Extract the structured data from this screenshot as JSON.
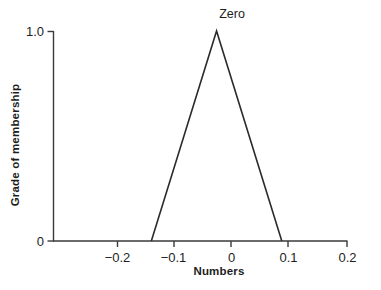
{
  "chart_data": {
    "type": "line",
    "title": "",
    "xlabel": "Numbers",
    "ylabel": "Grade of membership",
    "xlim": [
      -0.25,
      0.2
    ],
    "ylim": [
      0,
      1.0
    ],
    "grid": false,
    "legend": "none",
    "annotations": [
      {
        "text": "Zero",
        "x": 0,
        "y": 1.0
      }
    ],
    "xticks": [
      {
        "value": -0.2,
        "label": "−0.2"
      },
      {
        "value": -0.1,
        "label": "−0.1"
      },
      {
        "value": 0,
        "label": "0"
      },
      {
        "value": 0.1,
        "label": "0.1"
      },
      {
        "value": 0.2,
        "label": "0.2"
      }
    ],
    "yticks": [
      {
        "value": 0,
        "label": "0"
      },
      {
        "value": 1.0,
        "label": "1.0"
      }
    ],
    "series": [
      {
        "name": "Zero",
        "x": [
          -0.1,
          0,
          0.1
        ],
        "values": [
          0,
          1.0,
          0
        ],
        "color": "#2b2b2b",
        "line_width": 1.6
      }
    ]
  },
  "axes": {
    "line_color": "#3a3a3a",
    "background": "#ffffff"
  }
}
